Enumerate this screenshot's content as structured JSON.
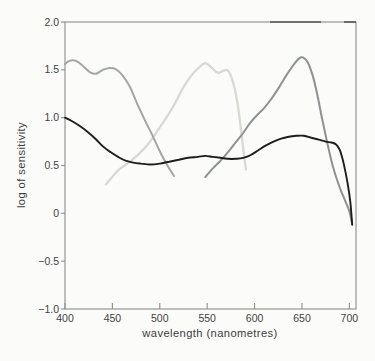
{
  "figure": {
    "background": "#fbfbfa",
    "frame_color": "#979797",
    "tick_color": "#8f8f8f",
    "label_color": "#3f3f3f"
  },
  "chart_data": {
    "type": "line",
    "title": "",
    "xlabel": "wavelength (nanometres)",
    "ylabel": "log of sensitivity",
    "xlim": [
      400,
      707
    ],
    "ylim": [
      -1.0,
      2.0
    ],
    "grid": false,
    "legend": "none",
    "x_ticks": [
      {
        "value": 400,
        "label": "400"
      },
      {
        "value": 450,
        "label": "450"
      },
      {
        "value": 500,
        "label": "500"
      },
      {
        "value": 550,
        "label": "550"
      },
      {
        "value": 600,
        "label": "600"
      },
      {
        "value": 650,
        "label": "650"
      },
      {
        "value": 700,
        "label": "700"
      }
    ],
    "y_ticks": [
      {
        "value": 2.0,
        "label": "2.0"
      },
      {
        "value": 1.5,
        "label": "1.5"
      },
      {
        "value": 1.0,
        "label": "1.0"
      },
      {
        "value": 0.5,
        "label": "0.5"
      },
      {
        "value": 0.0,
        "label": "0"
      },
      {
        "value": -0.5,
        "label": "−0.5"
      },
      {
        "value": -1.0,
        "label": "−1.0"
      }
    ],
    "series": [
      {
        "name": "light-gray-curve-peak-550nm",
        "color": "#d8d9d2",
        "width": 2.3,
        "points": [
          [
            443,
            0.3
          ],
          [
            449,
            0.37
          ],
          [
            456,
            0.45
          ],
          [
            463,
            0.5
          ],
          [
            471,
            0.56
          ],
          [
            480,
            0.64
          ],
          [
            489,
            0.74
          ],
          [
            498,
            0.87
          ],
          [
            507,
            1.0
          ],
          [
            516,
            1.15
          ],
          [
            525,
            1.32
          ],
          [
            534,
            1.45
          ],
          [
            542,
            1.53
          ],
          [
            548,
            1.57
          ],
          [
            554,
            1.53
          ],
          [
            561,
            1.47
          ],
          [
            567,
            1.49
          ],
          [
            572,
            1.49
          ],
          [
            577,
            1.38
          ],
          [
            582,
            1.15
          ],
          [
            586,
            0.85
          ],
          [
            589,
            0.6
          ],
          [
            591,
            0.46
          ]
        ]
      },
      {
        "name": "gray-curve-peak-410nm",
        "color": "#a3a6a6",
        "width": 2.0,
        "points": [
          [
            400,
            1.56
          ],
          [
            404,
            1.59
          ],
          [
            409,
            1.6
          ],
          [
            414,
            1.58
          ],
          [
            420,
            1.53
          ],
          [
            427,
            1.47
          ],
          [
            433,
            1.46
          ],
          [
            440,
            1.5
          ],
          [
            447,
            1.52
          ],
          [
            453,
            1.51
          ],
          [
            460,
            1.45
          ],
          [
            468,
            1.33
          ],
          [
            476,
            1.15
          ],
          [
            484,
            0.98
          ],
          [
            492,
            0.82
          ],
          [
            500,
            0.65
          ],
          [
            508,
            0.5
          ],
          [
            515,
            0.39
          ]
        ]
      },
      {
        "name": "gray-curve-peak-650nm",
        "color": "#8e9193",
        "width": 2.0,
        "points": [
          [
            548,
            0.38
          ],
          [
            556,
            0.47
          ],
          [
            564,
            0.55
          ],
          [
            572,
            0.64
          ],
          [
            580,
            0.74
          ],
          [
            588,
            0.84
          ],
          [
            595,
            0.94
          ],
          [
            602,
            1.02
          ],
          [
            610,
            1.1
          ],
          [
            618,
            1.2
          ],
          [
            626,
            1.32
          ],
          [
            634,
            1.45
          ],
          [
            641,
            1.55
          ],
          [
            647,
            1.62
          ],
          [
            651,
            1.63
          ],
          [
            656,
            1.58
          ],
          [
            661,
            1.45
          ],
          [
            666,
            1.25
          ],
          [
            671,
            1.0
          ],
          [
            676,
            0.77
          ],
          [
            681,
            0.55
          ],
          [
            686,
            0.38
          ],
          [
            691,
            0.24
          ],
          [
            696,
            0.12
          ],
          [
            700,
            0.02
          ],
          [
            703,
            -0.11
          ]
        ]
      },
      {
        "name": "black-curve",
        "color": "#1d1d1d",
        "width": 1.9,
        "points": [
          [
            400,
            1.0
          ],
          [
            408,
            0.96
          ],
          [
            416,
            0.91
          ],
          [
            424,
            0.85
          ],
          [
            432,
            0.78
          ],
          [
            440,
            0.7
          ],
          [
            448,
            0.64
          ],
          [
            456,
            0.59
          ],
          [
            464,
            0.55
          ],
          [
            472,
            0.53
          ],
          [
            480,
            0.52
          ],
          [
            490,
            0.51
          ],
          [
            500,
            0.52
          ],
          [
            510,
            0.54
          ],
          [
            520,
            0.56
          ],
          [
            530,
            0.58
          ],
          [
            540,
            0.59
          ],
          [
            548,
            0.6
          ],
          [
            556,
            0.59
          ],
          [
            564,
            0.58
          ],
          [
            572,
            0.57
          ],
          [
            580,
            0.57
          ],
          [
            588,
            0.58
          ],
          [
            596,
            0.61
          ],
          [
            604,
            0.66
          ],
          [
            612,
            0.71
          ],
          [
            620,
            0.75
          ],
          [
            628,
            0.78
          ],
          [
            636,
            0.8
          ],
          [
            644,
            0.81
          ],
          [
            652,
            0.81
          ],
          [
            660,
            0.79
          ],
          [
            668,
            0.77
          ],
          [
            675,
            0.75
          ],
          [
            681,
            0.74
          ],
          [
            686,
            0.72
          ],
          [
            690,
            0.66
          ],
          [
            694,
            0.52
          ],
          [
            698,
            0.32
          ],
          [
            701,
            0.12
          ],
          [
            703,
            -0.12
          ]
        ]
      }
    ]
  }
}
